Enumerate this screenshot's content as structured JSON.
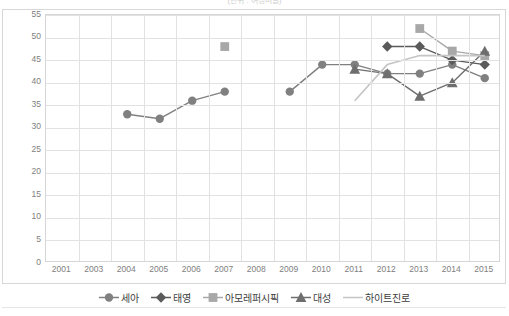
{
  "chart_title": "(단위 : 여성비율)",
  "axes": {
    "ylabel": "",
    "xlabel": "",
    "y_ticks": [
      0,
      5,
      10,
      15,
      20,
      25,
      30,
      35,
      40,
      45,
      50,
      55
    ],
    "x_ticks": [
      "2001",
      "2003",
      "2004",
      "2005",
      "2006",
      "2007",
      "2008",
      "2009",
      "2010",
      "2011",
      "2012",
      "2013",
      "2014",
      "2015"
    ]
  },
  "legend": {
    "position": "bottom",
    "entries": [
      {
        "label": "세아",
        "marker": "circle",
        "color": "#808080"
      },
      {
        "label": "태영",
        "marker": "diamond",
        "color": "#5a5a5a"
      },
      {
        "label": "아모레퍼시픽",
        "marker": "square",
        "color": "#a8a8a8"
      },
      {
        "label": "대성",
        "marker": "triangle",
        "color": "#6e6e6e"
      },
      {
        "label": "하이트진로",
        "marker": "none",
        "color": "#c4c4c4"
      }
    ]
  },
  "chart_data": {
    "type": "line",
    "title": "(단위 : 여성비율)",
    "xlabel": "",
    "ylabel": "",
    "ylim": [
      0,
      55
    ],
    "grid": true,
    "legend_position": "bottom",
    "categories": [
      "2001",
      "2003",
      "2004",
      "2005",
      "2006",
      "2007",
      "2008",
      "2009",
      "2010",
      "2011",
      "2012",
      "2013",
      "2014",
      "2015"
    ],
    "series": [
      {
        "name": "세아",
        "marker": "circle",
        "color": "#808080",
        "values": [
          null,
          null,
          33,
          32,
          36,
          38,
          null,
          38,
          44,
          44,
          42,
          42,
          44,
          41
        ]
      },
      {
        "name": "태영",
        "marker": "diamond",
        "color": "#5a5a5a",
        "values": [
          null,
          null,
          null,
          null,
          null,
          null,
          null,
          null,
          null,
          null,
          48,
          48,
          45,
          44
        ]
      },
      {
        "name": "아모레퍼시픽",
        "marker": "square",
        "color": "#a8a8a8",
        "values": [
          null,
          null,
          null,
          null,
          null,
          48,
          null,
          null,
          null,
          null,
          null,
          52,
          47,
          46
        ]
      },
      {
        "name": "대성",
        "marker": "triangle",
        "color": "#6e6e6e",
        "values": [
          null,
          null,
          null,
          null,
          null,
          null,
          null,
          null,
          null,
          43,
          42,
          37,
          40,
          47
        ]
      },
      {
        "name": "하이트진로",
        "marker": "none",
        "color": "#c4c4c4",
        "values": [
          null,
          null,
          null,
          null,
          null,
          null,
          null,
          null,
          null,
          36,
          44,
          46,
          46,
          46
        ]
      }
    ]
  }
}
